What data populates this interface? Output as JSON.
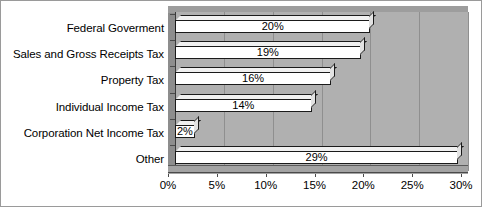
{
  "chart_data": {
    "type": "bar",
    "orientation": "horizontal",
    "title": "",
    "xlabel": "",
    "ylabel": "",
    "categories": [
      "Federal Goverment",
      "Sales and Gross Receipts Tax",
      "Property Tax",
      "Individual Income Tax",
      "Corporation Net Income Tax",
      "Other"
    ],
    "values": [
      20,
      19,
      16,
      14,
      2,
      29
    ],
    "value_labels": [
      "20%",
      "19%",
      "16%",
      "14%",
      "2%",
      "29%"
    ],
    "xlim": [
      0,
      30
    ],
    "xticks": [
      0,
      5,
      10,
      15,
      20,
      25,
      30
    ],
    "xtick_labels": [
      "0%",
      "5%",
      "10%",
      "15%",
      "20%",
      "25%",
      "30%"
    ],
    "grid": true,
    "grid_axis": "x",
    "legend": null,
    "style": "3d",
    "colors": {
      "bar_fill": "#ffffff",
      "bar_outline": "#1a1a1a",
      "plot_background": "#b0b0b0",
      "gridline": "#8f8f8f",
      "axis": "#3a3a3a",
      "canvas": "#ffffff",
      "border": "#9a9a9a"
    }
  }
}
